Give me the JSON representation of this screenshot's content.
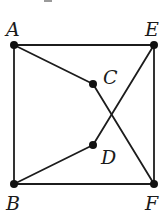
{
  "diagram": {
    "type": "graph",
    "colors": {
      "line": "#1c1c1c",
      "vertex": "#111111",
      "label": "#1a1a1a",
      "background": "#ffffff"
    },
    "vertices": [
      {
        "id": "A",
        "label": "A",
        "x": 14,
        "y": 45,
        "lx": 6,
        "ly": 36
      },
      {
        "id": "E",
        "label": "E",
        "x": 154,
        "y": 45,
        "lx": 145,
        "ly": 36
      },
      {
        "id": "C",
        "label": "C",
        "x": 93,
        "y": 84,
        "lx": 103,
        "ly": 84
      },
      {
        "id": "D",
        "label": "D",
        "x": 93,
        "y": 145,
        "lx": 101,
        "ly": 164
      },
      {
        "id": "B",
        "label": "B",
        "x": 14,
        "y": 184,
        "lx": 6,
        "ly": 210
      },
      {
        "id": "F",
        "label": "F",
        "x": 154,
        "y": 184,
        "lx": 145,
        "ly": 210
      }
    ],
    "edges": [
      {
        "from": "A",
        "to": "E"
      },
      {
        "from": "A",
        "to": "B"
      },
      {
        "from": "E",
        "to": "F"
      },
      {
        "from": "B",
        "to": "F"
      },
      {
        "from": "A",
        "to": "C"
      },
      {
        "from": "C",
        "to": "F"
      },
      {
        "from": "B",
        "to": "D"
      },
      {
        "from": "D",
        "to": "E"
      }
    ]
  }
}
